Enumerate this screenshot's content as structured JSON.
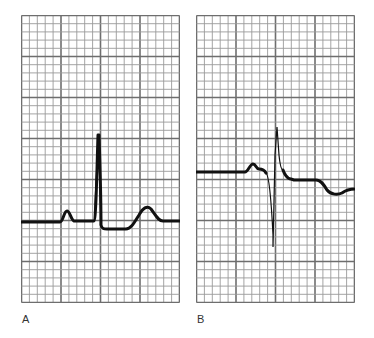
{
  "figure": {
    "type": "ECG strip comparison",
    "panels": [
      {
        "label": "A",
        "description": "Normal ECG complex: small upright P wave, tall narrow upright QRS, upright T wave",
        "grid": {
          "major_cols": 4,
          "major_rows": 7,
          "minor_per_major": 5
        }
      },
      {
        "label": "B",
        "description": "Biphasic P wave, small R then deep S wave (RS complex), elevated ST segment, inverted T wave",
        "grid": {
          "major_cols": 4,
          "major_rows": 7,
          "minor_per_major": 5
        }
      }
    ]
  },
  "colors": {
    "grid_minor": "#9a9a9a",
    "grid_major": "#6e6e6e",
    "trace": "#111111",
    "background": "#ffffff"
  }
}
